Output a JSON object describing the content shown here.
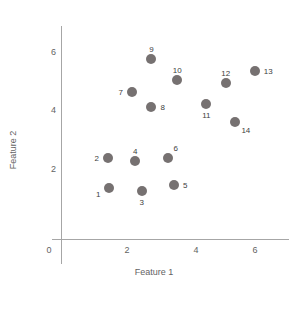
{
  "chart_data": {
    "type": "scatter",
    "title": "",
    "xlabel": "Feature 1",
    "ylabel": "Feature 2",
    "xlim": [
      0,
      6.8
    ],
    "ylim": [
      0,
      6.4
    ],
    "xticks": [
      0,
      2,
      4,
      6
    ],
    "xtick_labels": [
      "0",
      "2",
      "4",
      "6"
    ],
    "yticks": [
      2,
      4,
      6
    ],
    "ytick_labels": [
      "2",
      "4",
      "6"
    ],
    "grid": false,
    "legend": false,
    "marker_color": "#767171",
    "axis_color": "#a6a6a6",
    "points": [
      {
        "label": "1",
        "x": 1.5,
        "y": 1.4,
        "label_pos": "left-below"
      },
      {
        "label": "2",
        "x": 1.45,
        "y": 2.4,
        "label_pos": "left"
      },
      {
        "label": "3",
        "x": 2.5,
        "y": 1.3,
        "label_pos": "below"
      },
      {
        "label": "4",
        "x": 2.3,
        "y": 2.3,
        "label_pos": "above"
      },
      {
        "label": "5",
        "x": 3.5,
        "y": 1.5,
        "label_pos": "right"
      },
      {
        "label": "6",
        "x": 3.3,
        "y": 2.4,
        "label_pos": "above-right"
      },
      {
        "label": "7",
        "x": 2.2,
        "y": 4.6,
        "label_pos": "left"
      },
      {
        "label": "8",
        "x": 2.8,
        "y": 4.1,
        "label_pos": "right"
      },
      {
        "label": "9",
        "x": 2.8,
        "y": 5.7,
        "label_pos": "above"
      },
      {
        "label": "10",
        "x": 3.6,
        "y": 5.0,
        "label_pos": "above"
      },
      {
        "label": "11",
        "x": 4.5,
        "y": 4.2,
        "label_pos": "below"
      },
      {
        "label": "12",
        "x": 5.1,
        "y": 4.9,
        "label_pos": "above"
      },
      {
        "label": "13",
        "x": 6.0,
        "y": 5.3,
        "label_pos": "right"
      },
      {
        "label": "14",
        "x": 5.4,
        "y": 3.6,
        "label_pos": "below-right"
      }
    ]
  },
  "axes": {
    "x_title": "Feature 1",
    "y_title": "Feature 2",
    "x_ticks": [
      "0",
      "2",
      "4",
      "6"
    ],
    "y_ticks": [
      "6",
      "4",
      "2"
    ]
  }
}
